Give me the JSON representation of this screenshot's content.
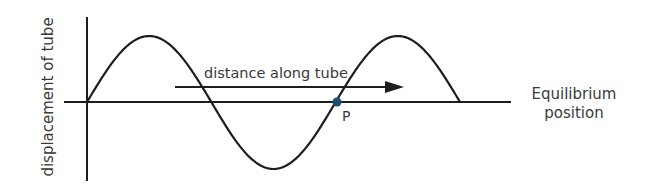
{
  "diagram": {
    "type": "transverse-wave-displacement-graph",
    "y_axis_label": "displacement of tube",
    "arrow_label": "distance along tube",
    "axis_label": "Equilibrium position",
    "axis_label_line1": "Equilibrium",
    "axis_label_line2": "position",
    "point_label": "P",
    "wave": {
      "wavelengths_shown": 1.5,
      "start_phase": "zero-crossing rising",
      "point_P": "zero crossing after first trough (rising)"
    },
    "colors": {
      "line": "#1e1e1e",
      "point": "#1d4e6e",
      "text": "#3a3a3a"
    }
  }
}
